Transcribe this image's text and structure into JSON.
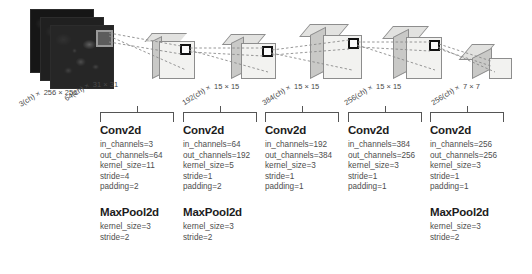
{
  "diagram": {
    "input": {
      "name": "input-image-stack",
      "channels_label": "3(ch) ×",
      "spatial_label": "256 × 256",
      "planes": 3
    },
    "volumes": [
      {
        "name": "conv1-output",
        "channels_label": "64(ch) ×",
        "spatial_label": "31 × 31"
      },
      {
        "name": "conv2-output",
        "channels_label": "192(ch) ×",
        "spatial_label": "15 × 15"
      },
      {
        "name": "conv3-output",
        "channels_label": "384(ch) ×",
        "spatial_label": "15 × 15"
      },
      {
        "name": "conv4-output",
        "channels_label": "256(ch) ×",
        "spatial_label": "15 × 15"
      },
      {
        "name": "conv5-output",
        "channels_label": "256(ch) ×",
        "spatial_label": "7 × 7"
      }
    ],
    "colors": {
      "box_front": "#f2f2f0",
      "box_top": "#e2e2e0",
      "box_side": "#c9c9c7",
      "outline": "#8d8d8d",
      "link": "#7a7a7a",
      "text": "#4e4e4e",
      "heading": "#1c1c1c",
      "background": "#ffffff"
    }
  },
  "columns": [
    {
      "conv": {
        "title": "Conv2d",
        "params": [
          "in_channels=3",
          "out_channels=64",
          "kernel_size=11",
          "stride=4",
          "padding=2"
        ]
      },
      "pool": {
        "title": "MaxPool2d",
        "params": [
          "kernel_size=3",
          "stride=2"
        ]
      }
    },
    {
      "conv": {
        "title": "Conv2d",
        "params": [
          "in_channels=64",
          "out_channels=192",
          "kernel_size=5",
          "stride=1",
          "padding=2"
        ]
      },
      "pool": {
        "title": "MaxPool2d",
        "params": [
          "kernel_size=3",
          "stride=2"
        ]
      }
    },
    {
      "conv": {
        "title": "Conv2d",
        "params": [
          "in_channels=192",
          "out_channels=384",
          "kernel_size=3",
          "stride=1",
          "padding=1"
        ]
      },
      "pool": null
    },
    {
      "conv": {
        "title": "Conv2d",
        "params": [
          "in_channels=384",
          "out_channels=256",
          "kernel_size=3",
          "stride=1",
          "padding=1"
        ]
      },
      "pool": null
    },
    {
      "conv": {
        "title": "Conv2d",
        "params": [
          "in_channels=256",
          "out_channels=256",
          "kernel_size=3",
          "stride=1",
          "padding=1"
        ]
      },
      "pool": {
        "title": "MaxPool2d",
        "params": [
          "kernel_size=3",
          "stride=2"
        ]
      }
    }
  ]
}
